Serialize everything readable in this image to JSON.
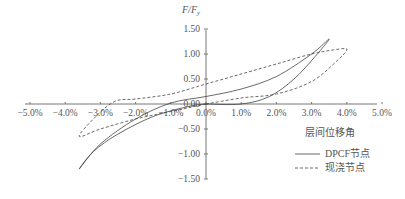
{
  "chart_data": {
    "type": "line",
    "title": "",
    "xlabel": "层间位移角",
    "ylabel": "F/Fy",
    "xlim": [
      -0.05,
      0.05
    ],
    "ylim": [
      -1.5,
      1.5
    ],
    "grid": false,
    "legend_position": "lower right",
    "x_ticks": [
      "-5.0%",
      "-4.0%",
      "-3.0%",
      "-2.0%",
      "-1.0%",
      "0.0%",
      "1.0%",
      "2.0%",
      "3.0%",
      "4.0%",
      "5.0%"
    ],
    "y_ticks": [
      "1.50",
      "1.00",
      "0.50",
      "0.00",
      "-0.50",
      "-1.00",
      "-1.50"
    ],
    "series": [
      {
        "name": "DPCF节点",
        "style": "solid",
        "x": [
          0.0,
          1.0,
          1.8,
          2.5,
          3.1,
          3.5,
          3.0,
          2.0,
          1.0,
          0.0,
          -1.0,
          -2.0,
          -3.0,
          -3.6,
          -3.2,
          -2.5,
          -1.5,
          -0.5,
          0.0
        ],
        "y": [
          0.0,
          0.0,
          0.15,
          0.5,
          0.95,
          1.3,
          1.0,
          0.55,
          0.3,
          0.15,
          0.02,
          -0.3,
          -0.8,
          -1.3,
          -0.95,
          -0.6,
          -0.25,
          -0.05,
          0.0
        ]
      },
      {
        "name": "现浇节点",
        "style": "dashed",
        "x": [
          0.0,
          1.0,
          2.0,
          3.0,
          3.7,
          4.0,
          3.8,
          3.0,
          2.0,
          1.0,
          0.0,
          -1.0,
          -2.0,
          -2.6,
          -3.2,
          -3.6,
          -3.0,
          -2.0,
          -1.0,
          0.0
        ],
        "y": [
          0.0,
          0.12,
          0.2,
          0.45,
          0.85,
          1.08,
          1.1,
          1.0,
          0.8,
          0.6,
          0.4,
          0.2,
          0.1,
          0.05,
          -0.3,
          -0.65,
          -0.5,
          -0.3,
          -0.15,
          0.0
        ]
      }
    ]
  },
  "legend": {
    "items": [
      {
        "label": "DPCF节点",
        "style": "solid"
      },
      {
        "label": "现浇节点",
        "style": "dashed"
      }
    ]
  },
  "colors": {
    "axis": "#666666",
    "series": "#444444",
    "text": "#555555"
  }
}
